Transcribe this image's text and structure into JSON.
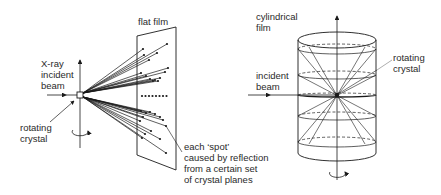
{
  "left_diagram": {
    "title": "flat film",
    "labels": {
      "beam": [
        "X-ray",
        "incident",
        "beam"
      ],
      "crystal": [
        "rotating",
        "crystal"
      ],
      "spot": [
        "each ‘spot’",
        "caused by reflection",
        "from a certain set",
        "of crystal planes"
      ]
    }
  },
  "right_diagram": {
    "title": [
      "cylindrical",
      "film"
    ],
    "labels": {
      "beam": [
        "incident",
        "beam"
      ],
      "crystal": [
        "rotating",
        "crystal"
      ]
    }
  },
  "colors": {
    "line": "#1a1a1a",
    "text": "#2a2a2a",
    "background": "#ffffff"
  }
}
